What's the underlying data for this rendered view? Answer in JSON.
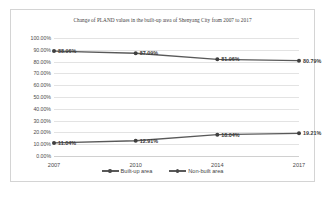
{
  "chart_data": {
    "type": "line",
    "title": "Change of PLAND values in the built-up area of Shenyang City from 2007 to 2017",
    "xlabel": "",
    "ylabel": "",
    "categories": [
      "2007",
      "2010",
      "2014",
      "2017"
    ],
    "ylim": [
      0,
      100
    ],
    "ytick_labels": [
      "100.00%",
      "90.00%",
      "80.00%",
      "70.00%",
      "60.00%",
      "50.00%",
      "40.00%",
      "30.00%",
      "20.00%",
      "10.00%",
      "0.00%"
    ],
    "ytick_values": [
      100,
      90,
      80,
      70,
      60,
      50,
      40,
      30,
      20,
      10,
      0
    ],
    "grid": true,
    "legend_position": "bottom",
    "series": [
      {
        "name": "Built-up area",
        "values": [
          11.04,
          12.91,
          18.04,
          19.21
        ],
        "data_labels": [
          "11.04%",
          "12.91%",
          "18.04%",
          "19.21%"
        ],
        "color": "#595959"
      },
      {
        "name": "Non-built area",
        "values": [
          88.96,
          87.09,
          81.96,
          80.79
        ],
        "data_labels": [
          "88.96%",
          "87.09%",
          "81.96%",
          "80.79%"
        ],
        "color": "#595959"
      }
    ]
  },
  "legend": {
    "items": [
      {
        "label": "Built-up area"
      },
      {
        "label": "Non-built area"
      }
    ]
  }
}
